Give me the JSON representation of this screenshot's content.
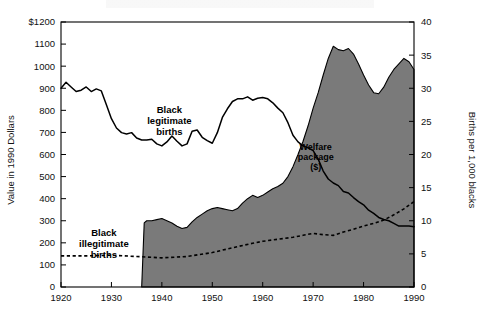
{
  "chart_data": {
    "type": "area",
    "title": "",
    "xlabel": "",
    "ylabel": "Value in 1990 Dollars",
    "y2label": "Births per 1,000 blacks",
    "xlim": [
      1920,
      1990
    ],
    "ylim": [
      0,
      1200
    ],
    "y2lim": [
      0,
      40
    ],
    "grid": false,
    "legend": "inline-annotations",
    "xticks": [
      1920,
      1930,
      1940,
      1950,
      1960,
      1970,
      1980,
      1990
    ],
    "xticklabels": [
      "1920",
      "1930",
      "1940",
      "1950",
      "1960",
      "1970",
      "1980",
      "1990"
    ],
    "yticks": [
      0,
      100,
      200,
      300,
      400,
      500,
      600,
      700,
      800,
      900,
      1000,
      1100,
      1200
    ],
    "yticklabels": [
      "0",
      "100",
      "200",
      "300",
      "400",
      "500",
      "600",
      "700",
      "800",
      "900",
      "1000",
      "1100",
      "$1200"
    ],
    "y2ticks": [
      0,
      5,
      10,
      15,
      20,
      25,
      30,
      35,
      40
    ],
    "y2ticklabels": [
      "0",
      "5",
      "10",
      "15",
      "20",
      "25",
      "30",
      "35",
      "40"
    ],
    "annotations": [
      {
        "name": "black-legitimate-births",
        "text": "Black\nlegitimate\nbirths",
        "x": 1941.5,
        "y": 790
      },
      {
        "name": "black-illegitimate-births",
        "text": "Black\nillegitimate\nbirths",
        "x": 1928.5,
        "y": 230
      },
      {
        "name": "welfare-package",
        "text": "Welfare\npackage\n($)",
        "x": 1970.5,
        "y": 620
      }
    ],
    "series": [
      {
        "name": "Welfare package ($)",
        "axis": "left",
        "style": "filled-area",
        "color": "#7a7a7a",
        "x": [
          1936,
          1936.5,
          1937,
          1938,
          1939,
          1940,
          1941,
          1942,
          1943,
          1944,
          1945,
          1946,
          1947,
          1948,
          1949,
          1950,
          1951,
          1952,
          1953,
          1954,
          1955,
          1956,
          1957,
          1958,
          1959,
          1960,
          1961,
          1962,
          1963,
          1964,
          1965,
          1966,
          1967,
          1968,
          1969,
          1970,
          1971,
          1972,
          1973,
          1974,
          1975,
          1976,
          1977,
          1978,
          1979,
          1980,
          1981,
          1982,
          1983,
          1984,
          1985,
          1986,
          1987,
          1988,
          1989,
          1990
        ],
        "y": [
          0,
          290,
          300,
          300,
          305,
          310,
          300,
          290,
          275,
          265,
          270,
          295,
          315,
          330,
          345,
          355,
          360,
          355,
          350,
          345,
          355,
          380,
          400,
          415,
          405,
          415,
          430,
          445,
          455,
          470,
          500,
          545,
          600,
          660,
          730,
          810,
          880,
          960,
          1035,
          1090,
          1075,
          1070,
          1080,
          1055,
          1010,
          960,
          915,
          880,
          875,
          905,
          950,
          985,
          1010,
          1035,
          1020,
          985
        ]
      },
      {
        "name": "Black legitimate births",
        "axis": "right",
        "style": "solid-line",
        "color": "#000000",
        "x": [
          1920,
          1921,
          1922,
          1923,
          1924,
          1925,
          1926,
          1927,
          1928,
          1929,
          1930,
          1931,
          1932,
          1933,
          1934,
          1935,
          1936,
          1937,
          1938,
          1939,
          1940,
          1941,
          1942,
          1943,
          1944,
          1945,
          1946,
          1947,
          1948,
          1949,
          1950,
          1951,
          1952,
          1953,
          1954,
          1955,
          1956,
          1957,
          1958,
          1959,
          1960,
          1961,
          1962,
          1963,
          1964,
          1965,
          1966,
          1967,
          1968,
          1969,
          1970,
          1971,
          1972,
          1973,
          1974,
          1975,
          1976,
          1977,
          1978,
          1979,
          1980,
          1981,
          1982,
          1983,
          1984,
          1985,
          1986,
          1987,
          1988,
          1989,
          1990
        ],
        "y": [
          30.0,
          30.9,
          30.2,
          29.5,
          29.7,
          30.2,
          29.5,
          29.9,
          29.6,
          27.5,
          25.4,
          24.0,
          23.3,
          23.1,
          23.3,
          22.5,
          22.2,
          22.2,
          22.3,
          21.6,
          21.3,
          21.9,
          22.8,
          22.0,
          21.3,
          21.6,
          23.5,
          23.7,
          22.6,
          22.1,
          21.7,
          23.3,
          25.6,
          26.9,
          28.0,
          28.4,
          28.4,
          28.7,
          28.2,
          28.5,
          28.6,
          28.4,
          27.8,
          27.0,
          26.3,
          24.8,
          22.9,
          21.9,
          21.3,
          21.0,
          20.6,
          19.3,
          17.5,
          16.3,
          15.7,
          15.3,
          14.4,
          14.2,
          13.5,
          12.9,
          12.4,
          11.6,
          11.1,
          10.5,
          10.2,
          10.0,
          9.6,
          9.2,
          9.2,
          9.2,
          9.1
        ]
      },
      {
        "name": "Black illegitimate births",
        "axis": "right",
        "style": "dashed-line",
        "color": "#000000",
        "x": [
          1920,
          1925,
          1930,
          1935,
          1940,
          1945,
          1950,
          1955,
          1958,
          1960,
          1962,
          1964,
          1966,
          1968,
          1970,
          1972,
          1974,
          1976,
          1978,
          1980,
          1982,
          1984,
          1986,
          1988,
          1990
        ],
        "y": [
          4.7,
          4.7,
          4.8,
          4.6,
          4.4,
          4.6,
          5.2,
          6.1,
          6.6,
          6.9,
          7.1,
          7.3,
          7.5,
          7.8,
          8.1,
          7.9,
          7.8,
          8.3,
          8.7,
          9.2,
          9.6,
          10.1,
          10.9,
          11.8,
          12.9
        ]
      }
    ]
  },
  "axes": {
    "left_title": "Value in 1990 Dollars",
    "right_title": "Births per 1,000 blacks"
  }
}
